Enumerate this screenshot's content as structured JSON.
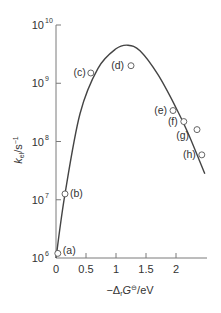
{
  "chart_data": {
    "type": "scatter",
    "title": "",
    "xlabel": "−ΔrG⊖/eV",
    "xlabel_parts": {
      "prefix": "−Δ",
      "sub": "r",
      "main": "G",
      "sup": "⊖",
      "suffix": "/eV"
    },
    "ylabel": "kel/s−1",
    "ylabel_parts": {
      "main": "k",
      "sub": "el",
      "suffix": "/s",
      "sup": "−1"
    },
    "yscale": "log",
    "xlim": [
      0,
      2.5
    ],
    "ylim": [
      1000000,
      10000000000
    ],
    "grid": false,
    "legend": "none",
    "x_ticks": [
      "0",
      "0.5",
      "1",
      "1.5",
      "2"
    ],
    "x_tick_values": [
      0,
      0.5,
      1,
      1.5,
      2
    ],
    "y_ticks": [
      {
        "base": "10",
        "exp": "6",
        "value": 1000000
      },
      {
        "base": "10",
        "exp": "7",
        "value": 10000000
      },
      {
        "base": "10",
        "exp": "8",
        "value": 100000000
      },
      {
        "base": "10",
        "exp": "9",
        "value": 1000000000
      },
      {
        "base": "10",
        "exp": "10",
        "value": 10000000000
      }
    ],
    "points": [
      {
        "label": "(a)",
        "x": 0.03,
        "y": 1200000
      },
      {
        "label": "(b)",
        "x": 0.15,
        "y": 12600000
      },
      {
        "label": "(c)",
        "x": 0.58,
        "y": 1500000000
      },
      {
        "label": "(d)",
        "x": 1.25,
        "y": 2000000000
      },
      {
        "label": "(e)",
        "x": 1.95,
        "y": 340000000
      },
      {
        "label": "(f)",
        "x": 2.13,
        "y": 220000000
      },
      {
        "label": "(g)",
        "x": 2.35,
        "y": 160000000
      },
      {
        "label": "(h)",
        "x": 2.43,
        "y": 59000000
      }
    ],
    "fit_curve": {
      "description": "Marcus theory fit (inverted parabola in log k)",
      "x": [
        0.0,
        0.15,
        0.4,
        0.7,
        1.0,
        1.2,
        1.4,
        1.7,
        2.0,
        2.2,
        2.48
      ],
      "y": [
        1000000,
        12600000,
        300000000,
        1800000000,
        3900000000,
        4500000000,
        3600000000,
        1400000000,
        380000000,
        140000000,
        28000000
      ]
    }
  }
}
